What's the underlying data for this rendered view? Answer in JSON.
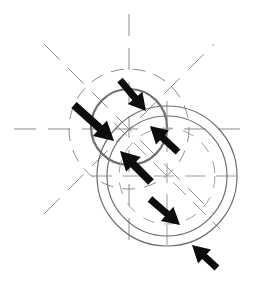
{
  "figure": {
    "canvas": {
      "width": 255,
      "height": 281,
      "background": "#ffffff"
    },
    "colors": {
      "construction_line": "#8c8c8c",
      "profile_circle": "#6e6e6e",
      "profile_circle_heavy": "#707070",
      "arrow_fill": "#0a0a0a",
      "background": "#ffffff"
    }
  },
  "geometry": {
    "circles": [
      {
        "name": "left-solid-circle",
        "style": "solid-heavy",
        "cx": 129,
        "cy": 127,
        "r": 38,
        "color": "#707070",
        "stroke_width": 2.2
      },
      {
        "name": "left-dashed-construction-circle",
        "style": "dashed",
        "cx": 129,
        "cy": 129,
        "r": 60,
        "color": "#8c8c8c",
        "stroke_width": 1,
        "dash": "13 9"
      },
      {
        "name": "right-outer-circle",
        "style": "solid",
        "cx": 167,
        "cy": 176,
        "r": 70,
        "color": "#6e6e6e",
        "stroke_width": 1.2
      },
      {
        "name": "right-inner-circle",
        "style": "solid",
        "cx": 167,
        "cy": 176,
        "r": 60,
        "color": "#6e6e6e",
        "stroke_width": 1.2
      },
      {
        "name": "right-dashed-construction-circle",
        "style": "dashed",
        "cx": 167,
        "cy": 176,
        "r": 48,
        "color": "#a0a0a0",
        "stroke_width": 1,
        "dash": "12 10"
      }
    ],
    "centerlines": [
      {
        "name": "left-centerline-horizontal",
        "x1": 14,
        "y1": 129,
        "x2": 244,
        "y2": 129,
        "dash": "22 12",
        "color": "#8c8c8c"
      },
      {
        "name": "left-centerline-vertical",
        "x1": 129,
        "y1": 14,
        "x2": 129,
        "y2": 243,
        "dash": "22 12",
        "color": "#8c8c8c"
      },
      {
        "name": "left-centerline-diagonal-ne",
        "x1": 44,
        "y1": 214,
        "x2": 214,
        "y2": 44,
        "dash": "22 12",
        "color": "#8c8c8c"
      },
      {
        "name": "left-centerline-diagonal-se",
        "x1": 44,
        "y1": 44,
        "x2": 214,
        "y2": 214,
        "dash": "22 12",
        "color": "#8c8c8c"
      },
      {
        "name": "right-centerline-horizontal",
        "x1": 92,
        "y1": 176,
        "x2": 242,
        "y2": 176,
        "dash": "20 11",
        "color": "#9a9a9a"
      },
      {
        "name": "right-centerline-vertical",
        "x1": 167,
        "y1": 101,
        "x2": 167,
        "y2": 251,
        "dash": "20 11",
        "color": "#9a9a9a"
      },
      {
        "name": "right-centerline-diagonal",
        "x1": 114,
        "y1": 123,
        "x2": 220,
        "y2": 229,
        "dash": "18 10",
        "color": "#9a9a9a"
      }
    ]
  },
  "arrows": [
    {
      "name": "arrow-top",
      "label": "arrow-1",
      "tail_x": 120,
      "tail_y": 80,
      "tip_x": 146,
      "tip_y": 111,
      "direction": "down-right",
      "shaft_width": 7,
      "head_width": 19,
      "head_length": 17
    },
    {
      "name": "arrow-upper-left",
      "label": "arrow-2",
      "tail_x": 74,
      "tail_y": 105,
      "tip_x": 114,
      "tip_y": 141,
      "direction": "down-right",
      "shaft_width": 8,
      "head_width": 21,
      "head_length": 19
    },
    {
      "name": "arrow-center-right",
      "label": "arrow-3",
      "tail_x": 178,
      "tail_y": 152,
      "tip_x": 150,
      "tip_y": 126,
      "direction": "up-left",
      "shaft_width": 7,
      "head_width": 19,
      "head_length": 17
    },
    {
      "name": "arrow-center-lower",
      "label": "arrow-4",
      "tail_x": 151,
      "tail_y": 182,
      "tip_x": 120,
      "tip_y": 151,
      "direction": "up-left",
      "shaft_width": 8,
      "head_width": 21,
      "head_length": 19
    },
    {
      "name": "arrow-lower-middle",
      "label": "arrow-5",
      "tail_x": 150,
      "tail_y": 199,
      "tip_x": 180,
      "tip_y": 225,
      "direction": "down-right",
      "shaft_width": 7,
      "head_width": 19,
      "head_length": 17
    },
    {
      "name": "arrow-bottom-right",
      "label": "arrow-6",
      "tail_x": 217,
      "tail_y": 268,
      "tip_x": 192,
      "tip_y": 245,
      "direction": "up-left",
      "shaft_width": 7,
      "head_width": 19,
      "head_length": 17
    }
  ],
  "chart_data": {
    "type": "diagram",
    "title": "",
    "annotations": [],
    "legend": []
  }
}
